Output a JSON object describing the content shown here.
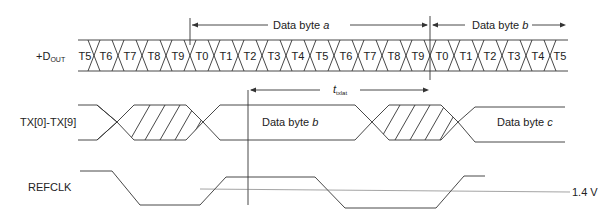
{
  "diagram": {
    "type": "timing-diagram",
    "signals": [
      {
        "id": "dout",
        "label": "+D",
        "subscript": "OUT"
      },
      {
        "id": "tx",
        "label": "TX[0]-TX[9]"
      },
      {
        "id": "refclk",
        "label": "REFCLK"
      }
    ],
    "dout_bits": [
      "T5",
      "T6",
      "T7",
      "T8",
      "T9",
      "T0",
      "T1",
      "T2",
      "T3",
      "T4",
      "T5",
      "T6",
      "T7",
      "T8",
      "T9",
      "T0",
      "T1",
      "T2",
      "T3",
      "T4",
      "T5"
    ],
    "annotations": {
      "byte_a": {
        "prefix": "Data  byte ",
        "var": "a"
      },
      "byte_b_top": {
        "prefix": "Data  byte ",
        "var": "b"
      },
      "txlat": {
        "symbol": "t",
        "subscript": "txlat"
      },
      "tx_byte_b": {
        "prefix": "Data byte ",
        "var": "b"
      },
      "tx_byte_c": {
        "prefix": "Data byte ",
        "var": "c"
      },
      "threshold": "1.4 V"
    },
    "colors": {
      "line": "#333333",
      "text": "#222222",
      "background": "#ffffff"
    }
  }
}
